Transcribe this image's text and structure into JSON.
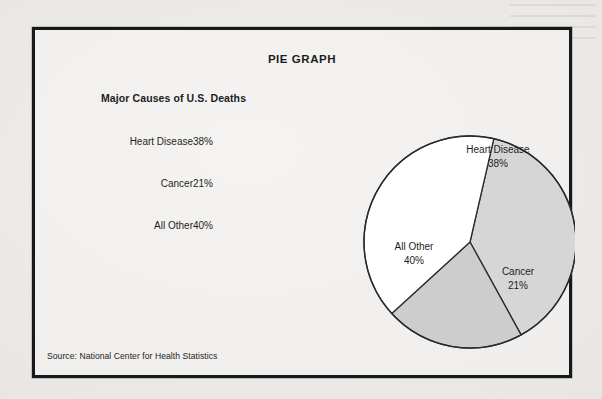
{
  "document": {
    "frame_title": "PIE GRAPH",
    "legend_heading": "Major Causes of U.S. Deaths",
    "source": "Source: National Center for Health Statistics"
  },
  "legend": {
    "rows": [
      {
        "category": "Heart Disease",
        "value": "38%"
      },
      {
        "category": "Cancer",
        "value": "21%"
      },
      {
        "category": "All Other",
        "value": "40%"
      }
    ]
  },
  "pie_labels": [
    {
      "name": "Heart Disease",
      "pct": "38%"
    },
    {
      "name": "Cancer",
      "pct": "21%"
    },
    {
      "name": "All Other",
      "pct": "40%"
    }
  ],
  "colors": {
    "frame_border": "#18181a",
    "paper": "#f2f1ef",
    "slice_heart_disease": "#d6d6d6",
    "slice_cancer": "#cdcdcd",
    "slice_all_other": "#ffffff",
    "outline": "#2b2b2d",
    "text": "#1c1c1e"
  },
  "chart_data": {
    "type": "pie",
    "title": "PIE GRAPH",
    "subtitle": "Major Causes of U.S. Deaths",
    "categories": [
      "Heart Disease",
      "Cancer",
      "All Other"
    ],
    "values": [
      38,
      21,
      40
    ],
    "value_labels": [
      "38%",
      "21%",
      "40%"
    ],
    "unit": "percent",
    "total": 99,
    "colors": [
      "#d6d6d6",
      "#cdcdcd",
      "#ffffff"
    ],
    "legend_position": "left-table",
    "grid": false,
    "xlabel": "",
    "ylabel": "",
    "annotations": [
      "Source: National Center for Health Statistics"
    ],
    "slice_geometry": {
      "center": [
        143,
        144
      ],
      "radius": 106,
      "start_angle_deg": -77,
      "direction": "clockwise",
      "spans_deg": [
        136.8,
        75.6,
        144.0
      ]
    }
  }
}
